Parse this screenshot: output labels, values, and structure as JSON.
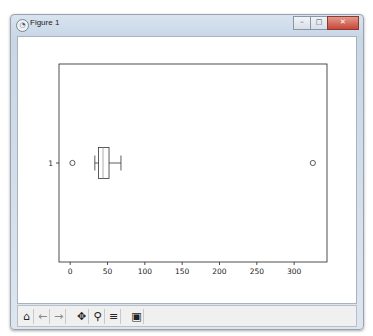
{
  "window": {
    "title": "Figure 1",
    "icon": "matplotlib-icon",
    "buttons": {
      "minimize": "–",
      "maximize": "□",
      "close": "✕"
    }
  },
  "toolbar": {
    "items": [
      {
        "name": "home-icon",
        "glyph": "⌂",
        "label": "Home"
      },
      {
        "name": "back-icon",
        "glyph": "←",
        "label": "Back"
      },
      {
        "name": "forward-icon",
        "glyph": "→",
        "label": "Forward"
      },
      {
        "name": "pan-icon",
        "glyph": "✥",
        "label": "Pan"
      },
      {
        "name": "zoom-icon",
        "glyph": "🔍",
        "label": "Zoom"
      },
      {
        "name": "configure-subplots-icon",
        "glyph": "☰",
        "label": "Subplots"
      },
      {
        "name": "save-icon",
        "glyph": "💾",
        "label": "Save"
      }
    ]
  },
  "chart_data": {
    "type": "boxplot",
    "orientation": "horizontal",
    "title": "",
    "xlabel": "",
    "ylabel": "",
    "xlim": [
      -15,
      344
    ],
    "xticks": [
      0,
      50,
      100,
      150,
      200,
      250,
      300
    ],
    "xtick_labels": [
      "0",
      "50",
      "100",
      "150",
      "200",
      "250",
      "300"
    ],
    "yticks": [
      1
    ],
    "ytick_labels": [
      "1"
    ],
    "grid": false,
    "legend": "none",
    "boxes": [
      {
        "position": 1,
        "whisker_low": 33,
        "q1": 38,
        "median": 44,
        "q3": 52,
        "whisker_high": 68,
        "outliers": [
          3,
          325
        ]
      }
    ]
  }
}
